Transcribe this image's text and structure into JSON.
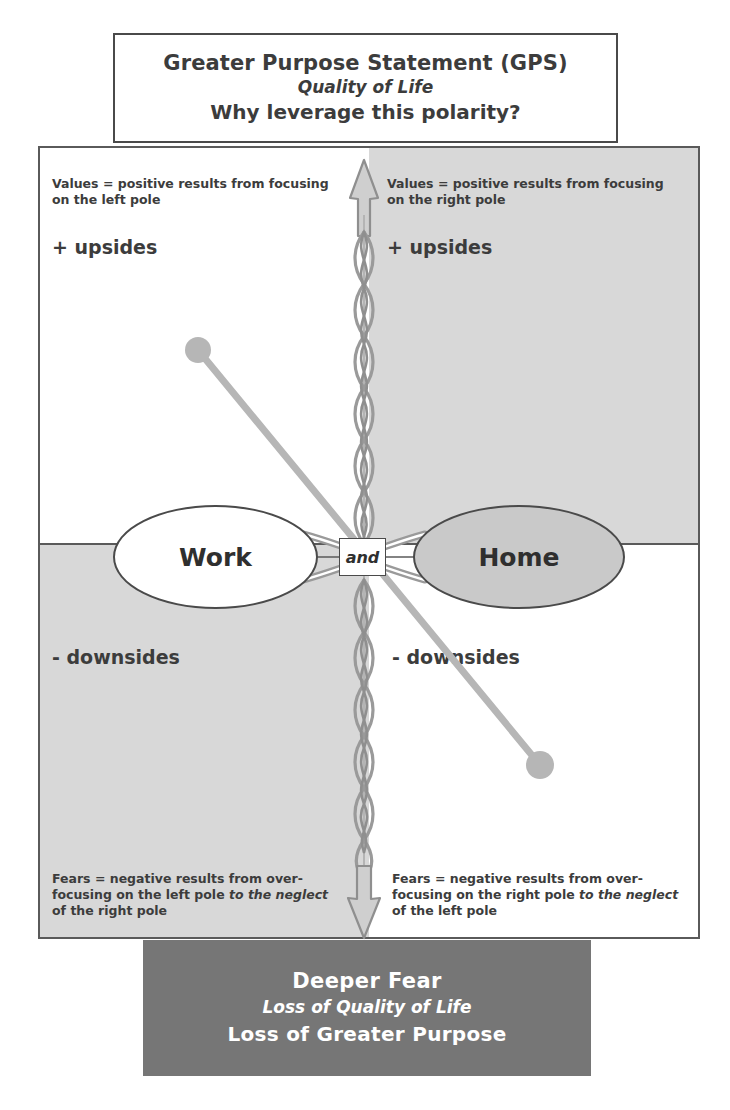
{
  "diagram": {
    "type": "polarity-map"
  },
  "gps": {
    "heading": "Greater Purpose Statement (GPS)",
    "subtitle": "Quality of Life",
    "question": "Why leverage this polarity?"
  },
  "poles": {
    "left": "Work",
    "right": "Home",
    "connector": "and"
  },
  "quadrants": {
    "upper_left": {
      "note_line1": "Values = positive results from focusing",
      "note_line2": "on the left pole",
      "label": "+ upsides"
    },
    "upper_right": {
      "note_line1": "Values = positive results from focusing",
      "note_line2": "on the right pole",
      "label": "+ upsides"
    },
    "lower_left": {
      "label": "- downsides",
      "note_line1": "Fears = negative results from over-",
      "note_line2a": "focusing on the left pole ",
      "note_line2b": "to the neglect",
      "note_line3": "of the right pole"
    },
    "lower_right": {
      "label": "- downsides",
      "note_line1": "Fears = negative results from over-",
      "note_line2a": "focusing on the right pole ",
      "note_line2b": "to the neglect",
      "note_line3": "of the left pole"
    }
  },
  "deeper_fear": {
    "heading": "Deeper Fear",
    "subtitle": "Loss of Quality of Life",
    "statement": "Loss of Greater Purpose"
  },
  "colors": {
    "quadrant_shaded": "#d8d8d8",
    "quadrant_plain": "#ffffff",
    "pole_right_fill": "#c9c9c9",
    "pole_left_fill": "#ffffff",
    "deeper_fear_bg": "#767676",
    "border": "#4a4a4a",
    "text": "#3c3c3c",
    "infinity_loop": "#9a9a9a",
    "pointer": "#b0b0b0"
  },
  "icons": {
    "up_arrow": "up-arrow-icon",
    "down_arrow": "down-arrow-icon",
    "infinity_loop": "infinity-loop-icon",
    "pointer_line": "pointer-line-icon"
  }
}
